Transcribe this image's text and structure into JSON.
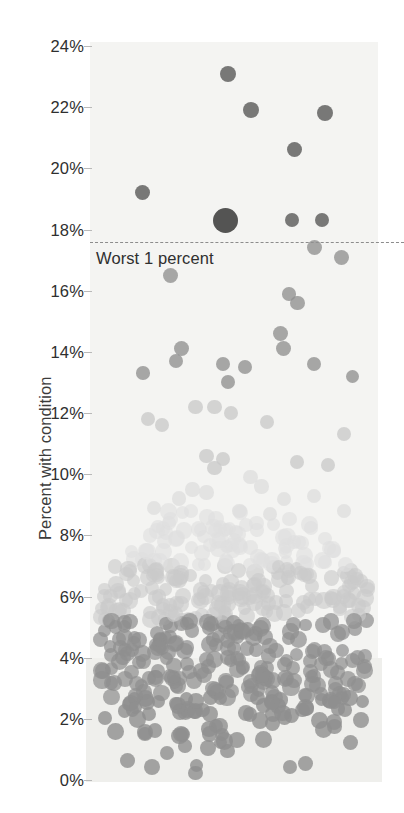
{
  "chart_data": {
    "type": "scatter",
    "title": "",
    "subtitle": "",
    "xlabel": "",
    "ylabel": "Percent with condition",
    "ylim": [
      -0.6,
      24.8
    ],
    "yticks": [
      0,
      2,
      4,
      6,
      8,
      10,
      12,
      14,
      16,
      18,
      20,
      22,
      24
    ],
    "ytick_labels": [
      "0%",
      "2%",
      "4%",
      "6%",
      "8%",
      "10%",
      "12%",
      "14%",
      "16%",
      "18%",
      "20%",
      "22%",
      "24%"
    ],
    "xticks": [],
    "xtick_labels": [],
    "grid": false,
    "legend": null,
    "legend_position": "none",
    "annotations": [
      {
        "name": "worst-1-percent-threshold",
        "text": "Worst 1 percent",
        "y_value": 17.6,
        "line_style": "dashed",
        "line_color": "#8c8c8c",
        "text_color": "#2f2f2f"
      }
    ],
    "colors": {
      "plot_background_upper": "#f4f4f2",
      "plot_background_lower": "#efefec",
      "page_background": "#ffffff",
      "dot_dark": "#545454",
      "dot_mid": "#8f8f8f",
      "dot_light": "#c9c9c9",
      "dot_pale": "#dedede",
      "dot_outlier_max": "#262626",
      "axis_text": "#2f2f2f",
      "tick_mark": "#b9b9b9"
    },
    "series": [
      {
        "name": "facilities",
        "description": "One dot per facility; dot radius scales with facility size; vertical position = percent of residents with condition. Horizontal position is jitter only.",
        "marker": "circle",
        "opacity": 0.78,
        "points": [
          {
            "x": 0.48,
            "y": 23.1,
            "r": 8.0,
            "shade": "dark"
          },
          {
            "x": 0.56,
            "y": 21.9,
            "r": 8.0,
            "shade": "dark"
          },
          {
            "x": 0.83,
            "y": 21.8,
            "r": 8.0,
            "shade": "dark"
          },
          {
            "x": 0.72,
            "y": 20.6,
            "r": 7.5,
            "shade": "dark"
          },
          {
            "x": 0.17,
            "y": 19.2,
            "r": 7.5,
            "shade": "dark"
          },
          {
            "x": 0.47,
            "y": 18.3,
            "r": 12.5,
            "shade": "max"
          },
          {
            "x": 0.71,
            "y": 18.3,
            "r": 7.0,
            "shade": "dark"
          },
          {
            "x": 0.82,
            "y": 18.3,
            "r": 7.0,
            "shade": "dark"
          },
          {
            "x": 0.79,
            "y": 17.4,
            "r": 7.5,
            "shade": "mid"
          },
          {
            "x": 0.89,
            "y": 17.1,
            "r": 7.5,
            "shade": "mid"
          },
          {
            "x": 0.27,
            "y": 16.5,
            "r": 7.5,
            "shade": "mid"
          },
          {
            "x": 0.7,
            "y": 15.9,
            "r": 6.8,
            "shade": "mid"
          },
          {
            "x": 0.73,
            "y": 15.6,
            "r": 7.2,
            "shade": "mid"
          },
          {
            "x": 0.67,
            "y": 14.6,
            "r": 7.5,
            "shade": "mid"
          },
          {
            "x": 0.68,
            "y": 14.1,
            "r": 7.5,
            "shade": "mid"
          },
          {
            "x": 0.31,
            "y": 14.1,
            "r": 7.5,
            "shade": "mid"
          },
          {
            "x": 0.29,
            "y": 13.7,
            "r": 7.2,
            "shade": "mid"
          },
          {
            "x": 0.46,
            "y": 13.6,
            "r": 7.2,
            "shade": "mid"
          },
          {
            "x": 0.54,
            "y": 13.5,
            "r": 7.0,
            "shade": "mid"
          },
          {
            "x": 0.79,
            "y": 13.6,
            "r": 7.0,
            "shade": "mid"
          },
          {
            "x": 0.17,
            "y": 13.3,
            "r": 6.8,
            "shade": "mid"
          },
          {
            "x": 0.48,
            "y": 13.0,
            "r": 7.0,
            "shade": "mid"
          },
          {
            "x": 0.93,
            "y": 13.2,
            "r": 6.5,
            "shade": "mid"
          },
          {
            "x": 0.36,
            "y": 12.2,
            "r": 7.2,
            "shade": "light"
          },
          {
            "x": 0.43,
            "y": 12.2,
            "r": 7.2,
            "shade": "light"
          },
          {
            "x": 0.49,
            "y": 12.0,
            "r": 7.0,
            "shade": "light"
          },
          {
            "x": 0.19,
            "y": 11.8,
            "r": 7.0,
            "shade": "light"
          },
          {
            "x": 0.24,
            "y": 11.6,
            "r": 7.0,
            "shade": "light"
          },
          {
            "x": 0.62,
            "y": 11.7,
            "r": 7.0,
            "shade": "light"
          },
          {
            "x": 0.9,
            "y": 11.3,
            "r": 7.0,
            "shade": "light"
          },
          {
            "x": 0.4,
            "y": 10.6,
            "r": 7.2,
            "shade": "light"
          },
          {
            "x": 0.46,
            "y": 10.5,
            "r": 7.2,
            "shade": "light"
          },
          {
            "x": 0.43,
            "y": 10.2,
            "r": 7.2,
            "shade": "light"
          },
          {
            "x": 0.73,
            "y": 10.4,
            "r": 7.0,
            "shade": "light"
          },
          {
            "x": 0.84,
            "y": 10.3,
            "r": 7.0,
            "shade": "light"
          },
          {
            "x": 0.56,
            "y": 9.9,
            "r": 7.2,
            "shade": "pale"
          },
          {
            "x": 0.6,
            "y": 9.6,
            "r": 7.2,
            "shade": "pale"
          },
          {
            "x": 0.35,
            "y": 9.5,
            "r": 7.2,
            "shade": "pale"
          },
          {
            "x": 0.4,
            "y": 9.4,
            "r": 7.2,
            "shade": "pale"
          },
          {
            "x": 0.3,
            "y": 9.2,
            "r": 7.2,
            "shade": "pale"
          },
          {
            "x": 0.68,
            "y": 9.2,
            "r": 7.0,
            "shade": "pale"
          },
          {
            "x": 0.79,
            "y": 9.3,
            "r": 7.0,
            "shade": "pale"
          },
          {
            "x": 0.21,
            "y": 8.9,
            "r": 7.2,
            "shade": "pale"
          },
          {
            "x": 0.52,
            "y": 8.8,
            "r": 7.2,
            "shade": "pale"
          },
          {
            "x": 0.63,
            "y": 8.7,
            "r": 7.2,
            "shade": "pale"
          },
          {
            "x": 0.9,
            "y": 8.8,
            "r": 7.0,
            "shade": "pale"
          }
        ],
        "dense_band": {
          "description": "Dense overlapping mass of facility dots from about 0% to 9%, ~520 dots, widest between 2% and 7%.",
          "y_range": [
            0.0,
            9.0
          ],
          "approx_count": 520
        }
      }
    ]
  },
  "axis": {
    "y_title": "Percent with condition"
  }
}
